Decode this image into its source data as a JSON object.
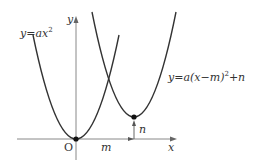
{
  "diagram": {
    "type": "coordinate-graph",
    "labels": {
      "y_axis": "y",
      "x_axis": "x",
      "origin": "O",
      "curve1": "y=ax",
      "curve1_exp": "2",
      "curve2_prefix": "y=a(x−m)",
      "curve2_exp": "2",
      "curve2_suffix": "+n",
      "m_label": "m",
      "n_label": "n"
    },
    "colors": {
      "curve": "#333333",
      "axis": "#888888",
      "point": "#111111"
    },
    "vertices": [
      {
        "name": "origin",
        "x": 0,
        "y": 0
      },
      {
        "name": "shifted",
        "x": "m",
        "y": "n"
      }
    ]
  }
}
